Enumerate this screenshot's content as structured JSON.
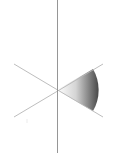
{
  "diagram": {
    "center": [
      57,
      90
    ],
    "vertical_line": {
      "x": 57,
      "y1": 0,
      "y2": 153,
      "color": "#8a8a8a"
    },
    "diagonals": [
      {
        "x1": 14,
        "y1": 64,
        "x2": 103,
        "y2": 117,
        "color": "#b8b8b8"
      },
      {
        "x1": 14,
        "y1": 117,
        "x2": 103,
        "y2": 64,
        "color": "#b8b8b8"
      }
    ],
    "wedge": {
      "radius": 42,
      "start_deg": -31,
      "end_deg": 31,
      "gradient_from": "#ffffff",
      "gradient_to": "#4a4a4a"
    }
  }
}
